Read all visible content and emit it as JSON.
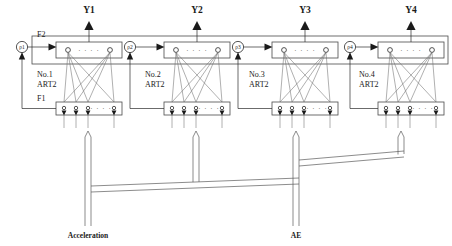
{
  "diagram": {
    "layer_labels": {
      "f2": "F2",
      "f1": "F1"
    },
    "vigilance_label": "ρ1",
    "colors": {
      "line": "#2b2b2b",
      "box": "#4a4a4a",
      "light_line": "#6e6e6e",
      "text": "#1a1a1a",
      "background": "#ffffff"
    },
    "outputs": [
      {
        "name": "Y1"
      },
      {
        "name": "Y2"
      },
      {
        "name": "Y3"
      },
      {
        "name": "Y4"
      }
    ],
    "modules": [
      {
        "index": 1,
        "number_label": "No.1",
        "type_label": "ART2",
        "output": "Y1",
        "vigilance": "ρ1",
        "f1_nodes": 4,
        "f2_nodes": 2
      },
      {
        "index": 2,
        "number_label": "No.2",
        "type_label": "ART2",
        "output": "Y2",
        "vigilance": "ρ2",
        "f1_nodes": 4,
        "f2_nodes": 2
      },
      {
        "index": 3,
        "number_label": "No.3",
        "type_label": "ART2",
        "output": "Y3",
        "vigilance": "ρ3",
        "f1_nodes": 4,
        "f2_nodes": 2
      },
      {
        "index": 4,
        "number_label": "No.4",
        "type_label": "ART2",
        "output": "Y4",
        "vigilance": "ρ4",
        "f1_nodes": 4,
        "f2_nodes": 2
      }
    ],
    "inputs": [
      {
        "name": "Acceleration",
        "feeds_modules": [
          1,
          2
        ]
      },
      {
        "name": "AE",
        "feeds_modules": [
          3,
          4
        ]
      }
    ],
    "ellipsis_glyph": "· · · ·"
  }
}
